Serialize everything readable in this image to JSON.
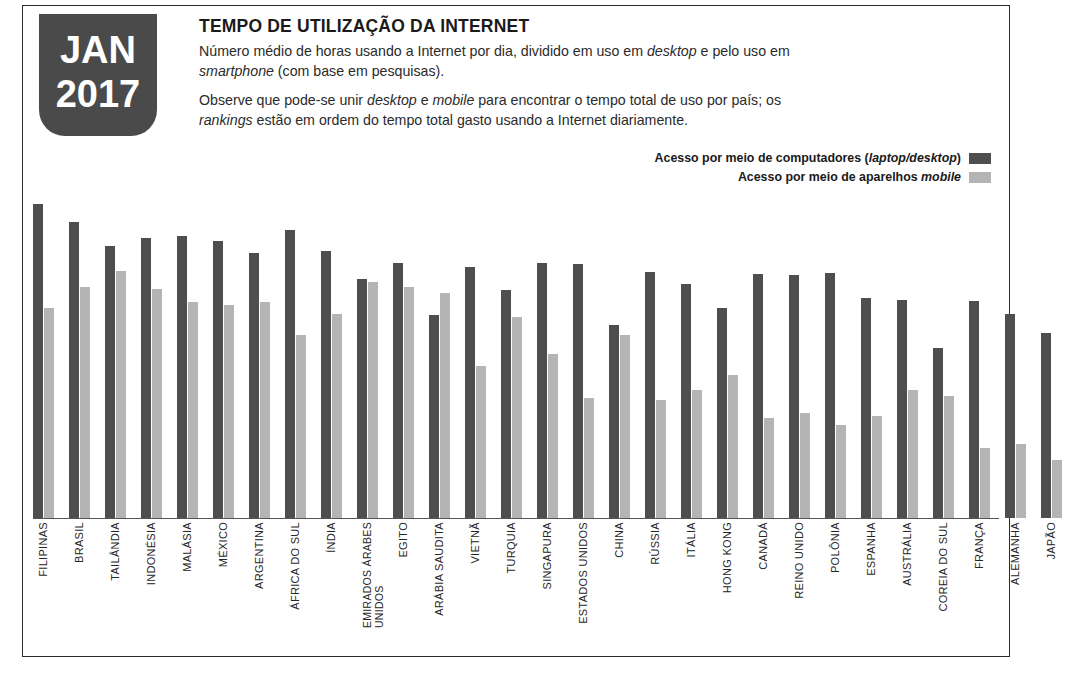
{
  "header": {
    "badge": {
      "month": "JAN",
      "year": "2017",
      "bg_color": "#4a4a4a"
    },
    "title": "TEMPO DE UTILIZAÇÃO DA INTERNET",
    "paragraph_1": "Número médio de horas usando a Internet por dia, dividido em uso em desktop e pelo uso em smartphone (com base em pesquisas).",
    "paragraph_2": "Observe que pode-se unir desktop e mobile para encontrar o tempo total de uso por país; os rankings estão em ordem do tempo total gasto usando a Internet diariamente."
  },
  "legend": {
    "items": [
      {
        "label": "Acesso por meio de computadores (laptop/desktop)",
        "color": "#4e4e4e"
      },
      {
        "label": "Acesso por meio de aparelhos mobile",
        "color": "#b4b4b4"
      }
    ]
  },
  "chart_data": {
    "type": "bar",
    "title": "TEMPO DE UTILIZAÇÃO DA INTERNET",
    "subtitle": "Número médio de horas usando a Internet por dia, dividido em uso em desktop e pelo uso em smartphone (com base em pesquisas).",
    "xlabel": "",
    "ylabel": "Horas por dia",
    "ylim": [
      0,
      7
    ],
    "grid": false,
    "legend_position": "top-right",
    "categories": [
      "FILIPINAS",
      "BRASIL",
      "TAILÂNDIA",
      "INDONÉSIA",
      "MALÁSIA",
      "MÉXICO",
      "ARGENTINA",
      "ÁFRICA DO SUL",
      "ÍNDIA",
      "EMIRADOS ÁRABES UNIDOS",
      "EGITO",
      "ARÁBIA SAUDITA",
      "VIETNÃ",
      "TURQUIA",
      "SINGAPURA",
      "ESTADOS UNIDOS",
      "CHINA",
      "RÚSSIA",
      "ITÁLIA",
      "HONG KONG",
      "CANADÁ",
      "REINO UNIDO",
      "POLÔNIA",
      "ESPANHA",
      "AUSTRÁLIA",
      "COREIA DO SUL",
      "FRANÇA",
      "ALEMANHA",
      "JAPÃO"
    ],
    "series": [
      {
        "name": "Acesso por meio de computadores (laptop/desktop)",
        "color": "#4e4e4e",
        "values": [
          6.4,
          5.9,
          5.6,
          5.8,
          5.8,
          5.7,
          5.4,
          5.9,
          5.5,
          5.1,
          5.3,
          4.5,
          5.0,
          4.7,
          5.0,
          5.0,
          4.2,
          4.8,
          4.6,
          4.3,
          4.7,
          4.7,
          4.8,
          4.4,
          4.5,
          3.9,
          4.4,
          4.2,
          4.0
        ]
      },
      {
        "name": "Acesso por meio de aparelhos mobile",
        "color": "#b4b4b4",
        "values": [
          4.3,
          4.7,
          4.9,
          4.7,
          4.4,
          4.4,
          4.4,
          3.8,
          4.1,
          5.1,
          5.1,
          4.8,
          3.3,
          4.2,
          3.6,
          2.9,
          3.6,
          3.0,
          3.1,
          3.4,
          2.5,
          2.4,
          2.3,
          2.6,
          2.9,
          3.2,
          1.6,
          1.6,
          1.3
        ]
      }
    ],
    "bar_pixel_tops": {
      "baseline_y": 510,
      "desktop": [
        196,
        214,
        238,
        230,
        228,
        233,
        245,
        222,
        243,
        271,
        255,
        307,
        259,
        282,
        255,
        256,
        317,
        264,
        276,
        300,
        266,
        267,
        265,
        290,
        292,
        340,
        293,
        306,
        325
      ],
      "mobile": [
        300,
        279,
        263,
        281,
        294,
        297,
        294,
        327,
        306,
        274,
        279,
        285,
        358,
        309,
        346,
        390,
        327,
        392,
        382,
        367,
        410,
        405,
        417,
        408,
        382,
        388,
        440,
        436,
        452
      ]
    }
  }
}
